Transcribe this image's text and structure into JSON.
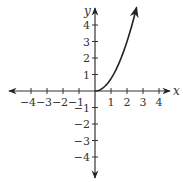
{
  "chart_data": {
    "type": "line",
    "title": "",
    "xlabel": "x",
    "ylabel": "y",
    "xlim": [
      -4.6,
      5
    ],
    "ylim": [
      -5,
      5
    ],
    "grid": false,
    "legend": null,
    "x_ticks": [
      -4,
      -3,
      -2,
      -1,
      1,
      2,
      3,
      4
    ],
    "x_tick_labels": [
      "−4",
      "−3",
      "−2",
      "−1",
      "1",
      "2",
      "3",
      "4"
    ],
    "y_ticks": [
      -4,
      -3,
      -2,
      -1,
      1,
      2,
      3,
      4
    ],
    "y_tick_labels": [
      "−4",
      "−3",
      "−2",
      "−1",
      "1",
      "2",
      "3",
      "4"
    ],
    "series": [
      {
        "name": "curve",
        "description": "half-parabola starting at origin, increasing, with arrow at end",
        "x": [
          0,
          0.5,
          1,
          1.5,
          2,
          2.5,
          2.6
        ],
        "y": [
          0,
          0.19,
          0.75,
          1.69,
          3,
          4.69,
          5.07
        ],
        "color": "#222222",
        "end_arrow": true
      }
    ],
    "axes_arrows": [
      "left",
      "right",
      "up",
      "down"
    ]
  },
  "colors": {
    "axis": "#333333",
    "curve": "#222222",
    "background": "#ffffff"
  }
}
